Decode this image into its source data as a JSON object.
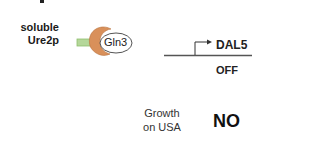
{
  "diagram": {
    "protein_label": {
      "line1": "soluble",
      "line2": "Ure2p"
    },
    "factor_label": "Gln3",
    "gene": {
      "name": "DAL5",
      "state": "OFF"
    },
    "phenotype": {
      "line1": "Growth",
      "line2": "on USA",
      "result": "NO"
    },
    "colors": {
      "ure2p_body": "#d9905a",
      "ure2p_tail": "#b5d79a",
      "gln3_border": "#555555",
      "dna_line": "#555555"
    }
  }
}
